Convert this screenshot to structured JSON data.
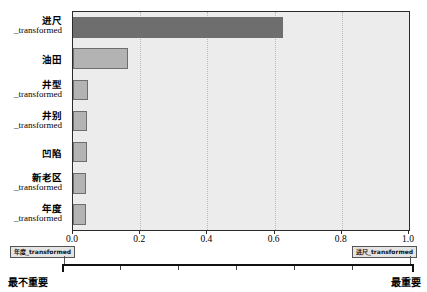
{
  "chart_data": {
    "type": "bar",
    "orientation": "horizontal",
    "title": "",
    "xlabel": "",
    "ylabel": "",
    "xlim": [
      0.0,
      1.0
    ],
    "grid": "vertical-dotted",
    "legend": "none",
    "categories": [
      "进尺_transformed",
      "油田",
      "井型_transformed",
      "井别_transformed",
      "凹陷",
      "新老区_transformed",
      "年度_transformed"
    ],
    "values": [
      0.625,
      0.165,
      0.045,
      0.042,
      0.042,
      0.04,
      0.04
    ],
    "bar_colors": [
      "#6e6e6e",
      "#b3b3b3",
      "#b3b3b3",
      "#b3b3b3",
      "#b3b3b3",
      "#b3b3b3",
      "#b3b3b3"
    ],
    "xticks": [
      0.0,
      0.2,
      0.4,
      0.6,
      0.8,
      1.0
    ],
    "xtick_labels": [
      "0.0",
      "0.2",
      "0.4",
      "0.6",
      "0.8",
      "1.0"
    ],
    "plot_background": "#ececec",
    "grid_color": "#b9b9b9",
    "axis_color": "#2b2b2b"
  },
  "ylabels": [
    {
      "cn": "进尺",
      "tr": "_transformed"
    },
    {
      "cn": "油田",
      "tr": ""
    },
    {
      "cn": "井型",
      "tr": "_transformed"
    },
    {
      "cn": "井别",
      "tr": "_transformed"
    },
    {
      "cn": "凹陷",
      "tr": ""
    },
    {
      "cn": "新老区",
      "tr": "_transformed"
    },
    {
      "cn": "年度",
      "tr": "_transformed"
    }
  ],
  "importance_scale": {
    "left_box": "年度_transformed",
    "right_box": "进尺_transformed",
    "left_end_label": "最不重要",
    "right_end_label": "最重要",
    "tick_count": 5
  }
}
